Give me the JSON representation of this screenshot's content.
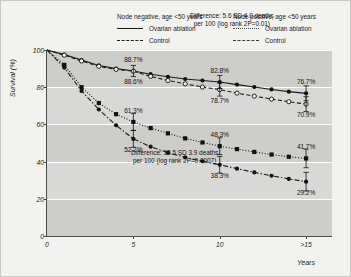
{
  "legend": {
    "node_negative": {
      "title": "Node negative, age <50 years",
      "entries": [
        {
          "label": "Ovarian ablation",
          "style": "solid",
          "icon": "solid-line-icon"
        },
        {
          "label": "Control",
          "style": "dashed",
          "icon": "dashed-line-icon"
        }
      ]
    },
    "node_positive": {
      "title": "Node positive, age <50 years",
      "entries": [
        {
          "label": "Ovarian ablation",
          "style": "dotted",
          "icon": "dotted-line-icon"
        },
        {
          "label": "Control",
          "style": "dashdot",
          "icon": "dash-dot-line-icon"
        }
      ]
    }
  },
  "annotations": {
    "top": {
      "line1": "Difference: 5.6 SD 4.0 deaths",
      "line2": "per 100 (log rank 2P=0.01)"
    },
    "bottom": {
      "line1": "Difference: 12.5 SD 3.9 deaths",
      "line2": "per 100 (log rank 2P=0.0007)"
    }
  },
  "chart_data": {
    "type": "line",
    "title": "",
    "xlabel": "Years",
    "ylabel": "Survival (%)",
    "xlim": [
      0,
      16.5
    ],
    "ylim": [
      0,
      100
    ],
    "yticks": [
      0,
      20,
      40,
      60,
      80,
      100
    ],
    "ytick_labels": [
      "0",
      "20",
      "40",
      "60",
      "80",
      "100"
    ],
    "xticks": [
      0,
      5,
      10,
      15
    ],
    "xtick_labels": [
      "0",
      "5",
      "10",
      ">15"
    ],
    "grid": "horizontal-white",
    "legend_position": "above-plot",
    "series": [
      {
        "name": "Node negative, age <50 years — Ovarian ablation",
        "group": "node_negative",
        "arm": "ovarian_ablation",
        "style": "solid",
        "marker": "filled-circle",
        "x": [
          0,
          1,
          2,
          3,
          4,
          5,
          6,
          7,
          8,
          9,
          10,
          11,
          12,
          13,
          14,
          15
        ],
        "y": [
          100,
          97.5,
          94.6,
          91.7,
          90.0,
          88.7,
          87.0,
          85.6,
          84.4,
          83.6,
          82.8,
          81.4,
          80.1,
          78.8,
          77.6,
          76.7
        ]
      },
      {
        "name": "Node negative, age <50 years — Control",
        "group": "node_negative",
        "arm": "control",
        "style": "dashed",
        "marker": "open-circle",
        "x": [
          0,
          1,
          2,
          3,
          4,
          5,
          6,
          7,
          8,
          9,
          10,
          11,
          12,
          13,
          14,
          15
        ],
        "y": [
          100,
          97.2,
          94.1,
          91.2,
          89.6,
          88.6,
          85.8,
          83.6,
          81.8,
          80.1,
          78.7,
          76.8,
          75.2,
          73.6,
          72.2,
          70.9
        ]
      },
      {
        "name": "Node positive, age <50 years — Ovarian ablation",
        "group": "node_positive",
        "arm": "ovarian_ablation",
        "style": "dotted",
        "marker": "filled-square",
        "x": [
          0,
          1,
          2,
          3,
          4,
          5,
          6,
          7,
          8,
          9,
          10,
          11,
          12,
          13,
          14,
          15
        ],
        "y": [
          100,
          92.0,
          80.0,
          71.5,
          65.5,
          61.3,
          58.0,
          55.2,
          52.5,
          50.3,
          48.3,
          46.7,
          45.2,
          43.8,
          42.6,
          41.7
        ]
      },
      {
        "name": "Node positive, age <50 years — Control",
        "group": "node_positive",
        "arm": "control",
        "style": "dashdot",
        "marker": "filled-circle",
        "x": [
          0,
          1,
          2,
          3,
          4,
          5,
          6,
          7,
          8,
          9,
          10,
          11,
          12,
          13,
          14,
          15
        ],
        "y": [
          100,
          90.5,
          78.0,
          68.0,
          59.5,
          52.2,
          48.0,
          44.8,
          42.3,
          40.2,
          38.3,
          36.2,
          34.2,
          32.4,
          30.7,
          29.2
        ]
      }
    ],
    "point_labels": [
      {
        "text": "88.7%",
        "x": 5,
        "y": 88.7,
        "place": "above",
        "series": "node_negative_ablation"
      },
      {
        "text": "88.6%",
        "x": 5,
        "y": 88.6,
        "place": "below",
        "series": "node_negative_control"
      },
      {
        "text": "82.8%",
        "x": 10,
        "y": 82.8,
        "place": "above",
        "series": "node_negative_ablation"
      },
      {
        "text": "78.7%",
        "x": 10,
        "y": 78.7,
        "place": "below",
        "series": "node_negative_control"
      },
      {
        "text": "76.7%",
        "x": 15,
        "y": 76.7,
        "place": "above",
        "series": "node_negative_ablation"
      },
      {
        "text": "70.9%",
        "x": 15,
        "y": 70.9,
        "place": "below",
        "series": "node_negative_control"
      },
      {
        "text": "61.3%",
        "x": 5,
        "y": 61.3,
        "place": "above",
        "series": "node_positive_ablation"
      },
      {
        "text": "52.2%",
        "x": 5,
        "y": 52.2,
        "place": "below",
        "series": "node_positive_control"
      },
      {
        "text": "48.3%",
        "x": 10,
        "y": 48.3,
        "place": "above",
        "series": "node_positive_ablation"
      },
      {
        "text": "38.3%",
        "x": 10,
        "y": 38.3,
        "place": "below",
        "series": "node_positive_control"
      },
      {
        "text": "41.7%",
        "x": 15,
        "y": 41.7,
        "place": "above",
        "series": "node_positive_ablation"
      },
      {
        "text": "29.2%",
        "x": 15,
        "y": 29.2,
        "place": "below",
        "series": "node_positive_control"
      }
    ],
    "error_bars": [
      {
        "x": 5,
        "y": 88.7,
        "half": 3.0
      },
      {
        "x": 5,
        "y": 61.3,
        "half": 4.5
      },
      {
        "x": 5,
        "y": 52.2,
        "half": 4.5
      },
      {
        "x": 10,
        "y": 82.8,
        "half": 3.5
      },
      {
        "x": 10,
        "y": 78.7,
        "half": 3.5
      },
      {
        "x": 10,
        "y": 48.3,
        "half": 4.5
      },
      {
        "x": 10,
        "y": 38.3,
        "half": 4.5
      },
      {
        "x": 15,
        "y": 76.7,
        "half": 4.0
      },
      {
        "x": 15,
        "y": 70.9,
        "half": 4.0
      },
      {
        "x": 15,
        "y": 41.7,
        "half": 5.0
      },
      {
        "x": 15,
        "y": 29.2,
        "half": 5.0
      }
    ]
  }
}
